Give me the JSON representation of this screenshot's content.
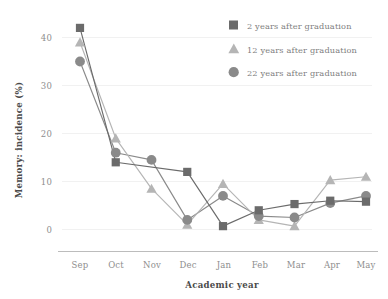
{
  "chart_data": {
    "type": "line",
    "title": "",
    "xlabel": "Academic year",
    "ylabel": "Memory: incidence (%)",
    "categories": [
      "Sep",
      "Oct",
      "Nov",
      "Dec",
      "Jan",
      "Feb",
      "Mar",
      "Apr",
      "May"
    ],
    "xlim": [
      0,
      8
    ],
    "ylim": [
      -2,
      44
    ],
    "yticks": [
      0,
      10,
      20,
      30,
      40
    ],
    "ytick_labels": [
      "0",
      "10",
      "20",
      "30",
      "40"
    ],
    "grid": "horizontal-faint",
    "legend_position": "top-right",
    "series": [
      {
        "name": "2 years after graduation",
        "marker": "square",
        "color": "#6b6b6b",
        "values": [
          42,
          14,
          null,
          12,
          0.7,
          4,
          5.3,
          6,
          5.8
        ]
      },
      {
        "name": "12 years after graduation",
        "marker": "triangle",
        "color": "#b5b5b5",
        "values": [
          39,
          19,
          8.5,
          1,
          9.5,
          2,
          0.7,
          10.3,
          11
        ]
      },
      {
        "name": "22 years after graduation",
        "marker": "circle",
        "color": "#8a8a8a",
        "values": [
          35,
          16,
          14.5,
          2,
          7,
          2.8,
          2.5,
          5.5,
          7
        ]
      }
    ]
  },
  "legend": {
    "items": [
      {
        "label": "2 years after graduation",
        "marker": "square",
        "color": "#6b6b6b"
      },
      {
        "label": "12 years after graduation",
        "marker": "triangle",
        "color": "#b5b5b5"
      },
      {
        "label": "22 years after graduation",
        "marker": "circle",
        "color": "#8a8a8a"
      }
    ]
  },
  "axes": {
    "x_title": "Academic year",
    "y_title": "Memory: incidence (%)",
    "x_tick_labels": [
      "Sep",
      "Oct",
      "Nov",
      "Dec",
      "Jan",
      "Feb",
      "Mar",
      "Apr",
      "May"
    ],
    "y_tick_labels": [
      "40",
      "30",
      "20",
      "10",
      "0"
    ]
  },
  "colors": {
    "background": "#ffffff",
    "axis_line": "#b9b9b9",
    "grid_line": "#f0f0f0",
    "tick_text": "#8e8e8e",
    "title_text": "#4a4a4a"
  }
}
